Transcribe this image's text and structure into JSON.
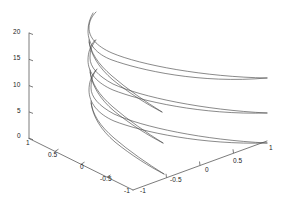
{
  "figure": {
    "kind": "matlab-3d-line-plot",
    "background_color": "#ffffff",
    "axis_color": "#5a5a5a",
    "curve_color": "#4a4a4a",
    "label_color": "#1a1a1a",
    "width": 291,
    "height": 218
  },
  "axes": {
    "z_axis": {
      "name": "z-axis",
      "ticks": [
        "20",
        "15",
        "10",
        "5",
        "0"
      ],
      "values": [
        20,
        15,
        10,
        5,
        0
      ],
      "range": [
        0,
        20
      ]
    },
    "x_axis": {
      "name": "x-axis-right",
      "ticks": [
        "-1",
        "-0.5",
        "0",
        "0.5",
        "1"
      ],
      "values": [
        -1,
        -0.5,
        0,
        0.5,
        1
      ],
      "range": [
        -1,
        1
      ]
    },
    "y_axis": {
      "name": "y-axis-left",
      "ticks": [
        "1",
        "0.5",
        "0",
        "-0.5",
        "-1"
      ],
      "values": [
        1,
        0.5,
        0,
        -0.5,
        -1
      ],
      "range": [
        -1,
        1
      ]
    }
  },
  "chart_data": {
    "type": "line",
    "title": "",
    "xlabel": "",
    "ylabel": "",
    "zlabel": "",
    "projection": "3d",
    "grid": false,
    "legend": false,
    "xlim": [
      -1,
      1
    ],
    "ylim": [
      -1,
      1
    ],
    "zlim": [
      0,
      20
    ],
    "xticks": [
      -1,
      -0.5,
      0,
      0.5,
      1
    ],
    "yticks": [
      1,
      0.5,
      0,
      -0.5,
      -1
    ],
    "zticks": [
      0,
      5,
      10,
      15,
      20
    ],
    "xticklabels": [
      "-1",
      "-0.5",
      "0",
      "0.5",
      "1"
    ],
    "yticklabels": [
      "1",
      "0.5",
      "0",
      "-0.5",
      "-1"
    ],
    "zticklabels": [
      "0",
      "5",
      "10",
      "15",
      "20"
    ],
    "series": [
      {
        "name": "curve-1",
        "path": "M 93 13 C 90 18 88 24 88 31 C 88 44 96 54 112 60 C 140 70 200 84 267 78"
      },
      {
        "name": "curve-2",
        "path": "M 267 78 C 205 77 140 65 112 53 C 96 46 89 37 89 28 C 89 21 92 16 96 12"
      },
      {
        "name": "curve-3",
        "path": "M 95 40 C 90 46 88 53 88 60 C 88 73 97 83 113 90 C 141 101 202 115 267 113"
      },
      {
        "name": "curve-4",
        "path": "M 267 113 C 204 110 141 97 113 84 C 98 76 90 67 90 58 C 90 50 92 45 96 40"
      },
      {
        "name": "curve-5",
        "path": "M 96 70 C 91 76 89 83 89 90 C 89 103 98 114 114 121 C 142 132 203 145 267 143"
      },
      {
        "name": "curve-6",
        "path": "M 267 143 C 204 140 142 127 114 114 C 99 106 91 97 91 88 C 91 80 93 74 97 69"
      },
      {
        "name": "curve-7",
        "path": "M 89 42 C 91 55 99 68 113 80 C 129 93 148 105 162 112"
      },
      {
        "name": "curve-8",
        "path": "M 162 112 C 146 102 127 89 112 76 C 98 64 90 52 89 40"
      },
      {
        "name": "curve-9",
        "path": "M 90 72 C 92 86 100 99 114 111 C 130 124 149 136 163 143"
      },
      {
        "name": "curve-10",
        "path": "M 163 143 C 147 133 128 120 113 107 C 99 95 91 83 90 70"
      },
      {
        "name": "curve-11",
        "path": "M 91 103 C 93 117 101 130 115 142 C 131 155 150 167 164 174"
      },
      {
        "name": "curve-12",
        "path": "M 164 174 C 148 164 129 151 114 138 C 100 126 92 114 91 101"
      }
    ]
  },
  "tick_labels": {
    "z": [
      {
        "text": "20",
        "x": 13,
        "y": 29
      },
      {
        "text": "15",
        "x": 13,
        "y": 55
      },
      {
        "text": "10",
        "x": 13,
        "y": 82
      },
      {
        "text": "5",
        "x": 17,
        "y": 108
      },
      {
        "text": "0",
        "x": 17,
        "y": 133
      }
    ],
    "y_left": [
      {
        "text": "1",
        "x": 26,
        "y": 140
      },
      {
        "text": "0.5",
        "x": 48,
        "y": 152
      },
      {
        "text": "0",
        "x": 80,
        "y": 164
      },
      {
        "text": "-0.5",
        "x": 100,
        "y": 176
      },
      {
        "text": "-1",
        "x": 124,
        "y": 188
      }
    ],
    "x_right": [
      {
        "text": "-1",
        "x": 140,
        "y": 188
      },
      {
        "text": "-0.5",
        "x": 170,
        "y": 177
      },
      {
        "text": "0",
        "x": 205,
        "y": 167
      },
      {
        "text": "0.5",
        "x": 233,
        "y": 158
      },
      {
        "text": "1",
        "x": 269,
        "y": 145
      }
    ]
  }
}
